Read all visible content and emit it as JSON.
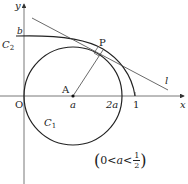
{
  "diagram": {
    "axes": {
      "x_label": "x",
      "y_label": "y",
      "origin_label": "O"
    },
    "points": {
      "P": "P",
      "A": "A"
    },
    "tick_labels": {
      "a": "a",
      "two_a": "2a",
      "one": "1",
      "b": "b"
    },
    "curves": {
      "C1": "C",
      "C1_sub": "1",
      "C2": "C",
      "C2_sub": "2"
    },
    "line_label": "l",
    "condition": {
      "open": "(",
      "lhs": "0<",
      "var": "a",
      "lt": "<",
      "numerator": "1",
      "denominator": "2",
      "close": ")"
    },
    "colors": {
      "stroke": "#222222",
      "axis": "#444444",
      "background": "#ffffff"
    }
  }
}
